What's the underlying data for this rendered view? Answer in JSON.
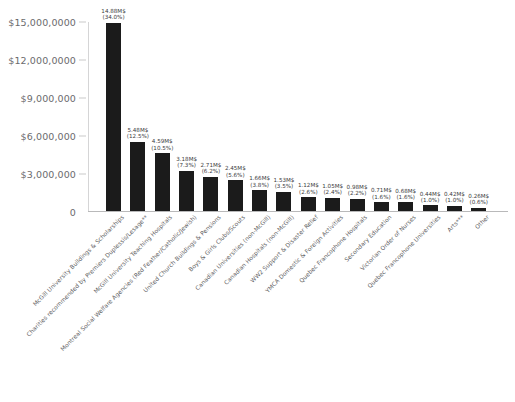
{
  "chart_data": {
    "type": "bar",
    "title": "",
    "subtitle": "",
    "xlabel": "",
    "ylabel": "",
    "ylim": [
      0,
      15000000
    ],
    "grid": false,
    "legend": "none",
    "orientation": "vertical",
    "bar_color": "#1b1b1b",
    "axis_color": "#b9b9ba",
    "text_color": "#58585a",
    "y_ticks": [
      {
        "value": 0,
        "label": "0"
      },
      {
        "value": 3000000,
        "label": "$3,000,000"
      },
      {
        "value": 6000000,
        "label": "$6,000,000"
      },
      {
        "value": 9000000,
        "label": "$9,000,000"
      },
      {
        "value": 12000000,
        "label": "$12,000,0000"
      },
      {
        "value": 15000000,
        "label": "$15,000,0000"
      }
    ],
    "categories": [
      "McGill University Buildings & Scholarships",
      "Charities recommended by Premiers Duplessis/Lesage**",
      "McGill University Teaching Hospitals",
      "Montreal Social Welfare Agencies (Red Feather/Catholic/Jewish)",
      "United Church Buildings & Pensions",
      "Boys & Girls Clubs/Scouts",
      "Canadian Universities (non-McGill)",
      "Canadian Hospitals (non-McGill)",
      "WW2 Support & Disaster Relief",
      "YMCA Domestic & Foreign Activities",
      "Quebec Francophone Hospitals",
      "Secondary Education",
      "Victorian Order of Nurses",
      "Quebec Francophone Universities",
      "Arts***",
      "Other"
    ],
    "values": [
      14880000,
      5480000,
      4590000,
      3180000,
      2710000,
      2450000,
      1660000,
      1530000,
      1120000,
      1050000,
      980000,
      710000,
      680000,
      440000,
      420000,
      260000
    ],
    "value_labels": [
      "14.88M$",
      "5.48M$",
      "4.59M$",
      "3.18M$",
      "2.71M$",
      "2.45M$",
      "1.66M$",
      "1.53M$",
      "1.12M$",
      "1.05M$",
      "0.98M$",
      "0.71M$",
      "0.68M$",
      "0.44M$",
      "0.42M$",
      "0.26M$"
    ],
    "percent_labels": [
      "(34.0%)",
      "(12.5%)",
      "(10.5%)",
      "(7.3%)",
      "(6.2%)",
      "(5.6%)",
      "(3.8%)",
      "(3.5%)",
      "(2.6%)",
      "(2.4%)",
      "(2.2%)",
      "(1.6%)",
      "(1.6%)",
      "(1.0%)",
      "(1.0%)",
      "(0.6%)"
    ],
    "percents": [
      34.0,
      12.5,
      10.5,
      7.3,
      6.2,
      5.6,
      3.8,
      3.5,
      2.6,
      2.4,
      2.2,
      1.6,
      1.6,
      1.0,
      1.0,
      0.6
    ]
  }
}
